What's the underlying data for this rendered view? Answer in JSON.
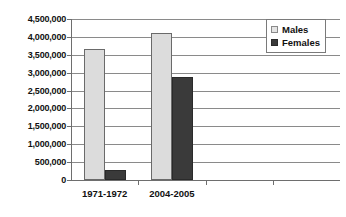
{
  "chart_data": {
    "type": "bar",
    "title": "",
    "subtitle": "",
    "xlabel": "",
    "ylabel": "",
    "categories": [
      "1971-1972",
      "2004-2005"
    ],
    "axis_slots": [
      "1971-1972",
      "2004-2005",
      "",
      ""
    ],
    "series": [
      {
        "name": "Males",
        "color": "#dcdcdc",
        "values": [
          3650000,
          4110000
        ]
      },
      {
        "name": "Females",
        "color": "#3a3a3a",
        "values": [
          280000,
          2880000
        ]
      }
    ],
    "ylim": [
      0,
      4500000
    ],
    "ytick_step": 500000,
    "ytick_labels": [
      "4,500,000",
      "4,000,000",
      "3,500,000",
      "3,000,000",
      "2,500,000",
      "2,000,000",
      "1,500,000",
      "1,000,000",
      "500,000",
      "0"
    ],
    "ytick_values": [
      4500000,
      4000000,
      3500000,
      3000000,
      2500000,
      2000000,
      1500000,
      1000000,
      500000,
      0
    ],
    "grid": true,
    "grid_axis": "y",
    "legend_position": "top-right",
    "legend_entries": [
      "Males",
      "Females"
    ]
  }
}
